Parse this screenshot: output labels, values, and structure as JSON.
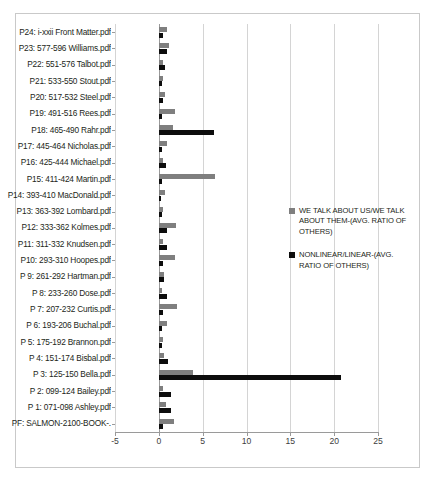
{
  "chart_data": {
    "type": "bar",
    "orientation": "horizontal",
    "title": "",
    "xlabel": "",
    "ylabel": "",
    "xlim": [
      -5,
      25
    ],
    "xticks": [
      -5,
      0,
      5,
      10,
      15,
      20,
      25
    ],
    "grid": true,
    "legend_position": "right",
    "categories": [
      "P24: i-xxii Front Matter.pdf",
      "P23: 577-596 Williams.pdf",
      "P22: 551-576 Talbot.pdf",
      "P21: 533-550 Stout.pdf",
      "P20: 517-532 Steel.pdf",
      "P19: 491-516 Rees.pdf",
      "P18: 465-490 Rahr.pdf",
      "P17: 445-464 Nicholas.pdf",
      "P16: 425-444 Michael.pdf",
      "P15: 411-424 Martin.pdf",
      "P14: 393-410 MacDonald.pdf",
      "P13: 363-392 Lombard.pdf",
      "P12: 333-362 Kolmes.pdf",
      "P11: 311-332 Knudsen.pdf",
      "P10: 293-310 Hoopes.pdf",
      "P 9: 261-292 Hartman.pdf",
      "P 8: 233-260 Dose.pdf",
      "P 7: 207-232 Curtis.pdf",
      "P 6: 193-206 Buchal.pdf",
      "P 5: 175-192 Brannon.pdf",
      "P 4: 151-174 Bisbal.pdf",
      "P 3: 125-150 Bella.pdf",
      "P 2: 099-124 Bailey.pdf",
      "P 1: 071-098 Ashley.pdf",
      "PF: SALMON-2100-BOOK-."
    ],
    "series": [
      {
        "name": "WE TALK ABOUT US/WE TALK ABOUT THEM-(AVG. RATIO OF OTHERS)",
        "color": "#7f7f7f",
        "values": [
          0.9,
          1.2,
          0.5,
          0.5,
          0.7,
          1.9,
          1.6,
          0.9,
          0.5,
          6.4,
          0.7,
          0.5,
          2.0,
          0.5,
          1.9,
          0.6,
          0.4,
          2.1,
          0.9,
          0.5,
          0.6,
          3.9,
          0.5,
          0.8,
          1.7
        ]
      },
      {
        "name": "NONLINEAR/LINEAR-(AVG. RATIO OF OTHERS)",
        "color": "#0d0d0d",
        "values": [
          0.5,
          0.9,
          0.7,
          0.4,
          0.5,
          0.4,
          6.3,
          0.4,
          0.8,
          0.4,
          0.3,
          0.4,
          0.9,
          0.9,
          0.5,
          0.6,
          0.9,
          0.5,
          0.4,
          0.4,
          1.1,
          20.8,
          1.4,
          1.4,
          0.5
        ]
      }
    ]
  },
  "legend": {
    "entries": [
      {
        "label": "WE TALK ABOUT US/WE TALK ABOUT THEM-(AVG. RATIO OF OTHERS)",
        "color": "#7f7f7f"
      },
      {
        "label": "NONLINEAR/LINEAR-(AVG. RATIO OF OTHERS)",
        "color": "#0d0d0d"
      }
    ]
  }
}
